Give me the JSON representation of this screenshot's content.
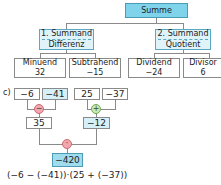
{
  "tree": {
    "root": {
      "label": "Summe"
    },
    "left": {
      "top": "1. Summand",
      "bottom": "Differenz",
      "children": [
        {
          "label": "Minuend",
          "value": "32"
        },
        {
          "label": "Subtrahend",
          "value": "−15"
        }
      ]
    },
    "right": {
      "top": "2. Summand",
      "bottom": "Quotient",
      "children": [
        {
          "label": "Dividend",
          "value": "−24"
        },
        {
          "label": "Divisor",
          "value": "6"
        }
      ]
    }
  },
  "part_c": {
    "label": "c)",
    "inputs": [
      "−6",
      "−41",
      "25",
      "−37"
    ],
    "ops": {
      "left": "−",
      "right": "+",
      "bottom": "·"
    },
    "intermediate": [
      "35",
      "−12"
    ],
    "result": "−420",
    "formula": "(−6 − (−41))·(25 + (−37))"
  },
  "colors": {
    "blue_fill": "#d6f0f7",
    "blue_strong": "#7fd3ea",
    "red_op": "#f3a6ad",
    "green_op": "#c9ecb0"
  }
}
